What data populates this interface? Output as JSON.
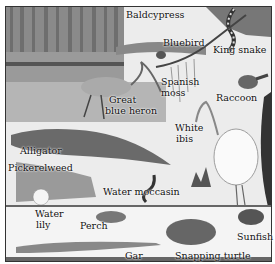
{
  "diagram": {
    "labels": [
      {
        "id": "baldcypress",
        "text": "Baldcypress",
        "x": 126,
        "y": 10
      },
      {
        "id": "bluebird",
        "text": "Bluebird",
        "x": 163,
        "y": 38
      },
      {
        "id": "king-snake",
        "text": "King snake",
        "x": 213,
        "y": 45
      },
      {
        "id": "spanish-moss-1",
        "text": "Spanish",
        "x": 161,
        "y": 77
      },
      {
        "id": "spanish-moss-2",
        "text": "moss",
        "x": 161,
        "y": 88
      },
      {
        "id": "raccoon",
        "text": "Raccoon",
        "x": 216,
        "y": 93
      },
      {
        "id": "heron-1",
        "text": "Great",
        "x": 109,
        "y": 95
      },
      {
        "id": "heron-2",
        "text": "blue heron",
        "x": 105,
        "y": 106
      },
      {
        "id": "ibis-1",
        "text": "White",
        "x": 175,
        "y": 123
      },
      {
        "id": "ibis-2",
        "text": "ibis",
        "x": 176,
        "y": 134
      },
      {
        "id": "alligator",
        "text": "Alligator",
        "x": 20,
        "y": 146
      },
      {
        "id": "pickerelweed",
        "text": "Pickerelweed",
        "x": 8,
        "y": 163
      },
      {
        "id": "water-moccasin",
        "text": "Water moccasin",
        "x": 103,
        "y": 187
      },
      {
        "id": "water-lily-1",
        "text": "Water",
        "x": 35,
        "y": 209
      },
      {
        "id": "water-lily-2",
        "text": "lily",
        "x": 36,
        "y": 220
      },
      {
        "id": "perch",
        "text": "Perch",
        "x": 80,
        "y": 221
      },
      {
        "id": "sunfish",
        "text": "Sunfish",
        "x": 237,
        "y": 232
      },
      {
        "id": "gar",
        "text": "Gar",
        "x": 125,
        "y": 251
      },
      {
        "id": "snapping-turtle",
        "text": "Snapping turtle",
        "x": 175,
        "y": 251
      }
    ]
  }
}
